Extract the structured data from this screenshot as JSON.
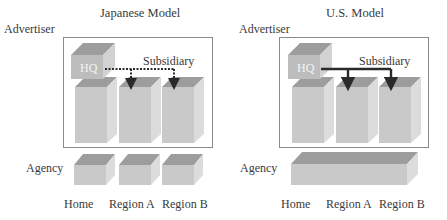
{
  "diagrams": [
    {
      "title": "Japanese Model",
      "advertiser_label": "Advertiser",
      "agency_label": "Agency",
      "hq_label": "HQ",
      "subsidiary_label": "Subsidiary",
      "link_style": "dotted",
      "agency_structure": "separate agencies per region",
      "columns": [
        "Home",
        "Region A",
        "Region B"
      ]
    },
    {
      "title": "U.S. Model",
      "advertiser_label": "Advertiser",
      "agency_label": "Agency",
      "hq_label": "HQ",
      "subsidiary_label": "Subsidiary",
      "link_style": "solid",
      "agency_structure": "single global agency",
      "columns": [
        "Home",
        "Region A",
        "Region B"
      ]
    }
  ],
  "colors": {
    "front_face": "#c9c9c9",
    "top_face": "#9d9d9d",
    "side_face": "#dcdcdc",
    "hq_front": "#bdbdbd",
    "frame": "#8a8a8a",
    "arrow": "#2a2a2a",
    "text": "#3a3a3a"
  }
}
